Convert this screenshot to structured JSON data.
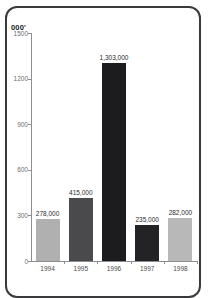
{
  "chart_data": {
    "type": "bar",
    "title": "",
    "subtitle": "",
    "unit_label": "000'",
    "xlabel": "",
    "ylabel": "",
    "categories": [
      "1994",
      "1995",
      "1996",
      "1997",
      "1998"
    ],
    "values": [
      278,
      415,
      1303,
      235,
      282
    ],
    "value_labels": [
      "278,000",
      "415,000",
      "1,303,000",
      "235,000",
      "282,000"
    ],
    "bar_colors": [
      "#b0b0b0",
      "#4a4a4c",
      "#1c1c1e",
      "#232325",
      "#b8b8b8"
    ],
    "ylim": [
      0,
      1500
    ],
    "yticks": [
      0,
      300,
      600,
      900,
      1200,
      1500
    ],
    "ytick_labels": [
      "0",
      "300",
      "600",
      "900",
      "1200",
      "1500"
    ],
    "grid": false,
    "legend": null
  },
  "frame": {
    "border_color": "#3a3a3c",
    "background": "#ffffff"
  },
  "axis": {
    "line_color": "#8e8e90",
    "tick_text_color": "#6e6e70"
  }
}
